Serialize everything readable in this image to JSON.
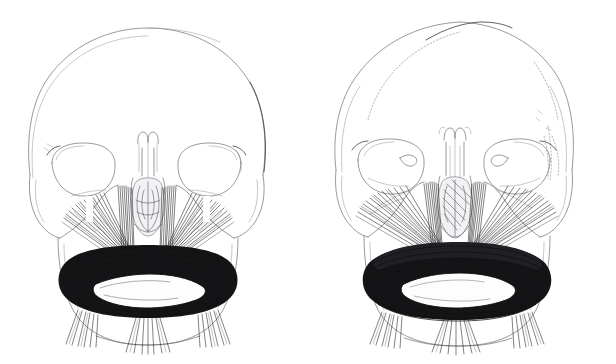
{
  "figure": {
    "background_color": "#ffffff",
    "width": 616,
    "height": 364,
    "medium": "pen-and-ink anatomical line drawing",
    "panel_count": 2
  },
  "palette": {
    "background": "#ffffff",
    "bone_outline": "#6e6e73",
    "bone_faint": "#9a9aa0",
    "bone_dark": "#3a3a3e",
    "suture": "#8a8a90",
    "muscle_fiber": "#1a1a1c",
    "muscle_soft": "#44444a",
    "orbicularis_mass": "#141416",
    "mouth_aperture": "#fdfdfd",
    "nasal_cartilage": "#4a4a50"
  },
  "panels": [
    {
      "id": "left",
      "label": "Left figure",
      "caption": "",
      "skull": {
        "name": "frontal-skull-left",
        "cranium_style": "plain smooth vault, no sutures drawn",
        "orbits": 2,
        "mandible": "broad rounded symphysis"
      },
      "muscles": {
        "orbicularis_oris": "dense near-black elliptical band encircling the oral aperture",
        "levator_group": "paired vertical fiber bundles from infraorbital margin to upper lip",
        "zygomatic_group": "oblique fiber bundles from zygomatic arch to modiolus",
        "depressor_group": "fan of fibers descending from lower lip over the chin",
        "mentalis": "central chin fan"
      }
    },
    {
      "id": "right",
      "label": "Right figure",
      "caption": "",
      "skull": {
        "name": "frontal-skull-right",
        "cranium_style": "vault outlined with stippled coronal and lambdoid suture marks",
        "orbits": 2,
        "mandible": "broad rounded symphysis"
      },
      "muscles": {
        "orbicularis_oris": "heavy layered black band, fibers swept laterally into the cheeks",
        "levator_group": "steep converging bundles beside the nasal aperture",
        "zygomatic_group": "long radiating bundles reaching far laterally to the rami",
        "depressor_group": "fan of fibers descending from lower lip over the chin",
        "mentalis": "central chin fan"
      }
    }
  ],
  "annotations": {
    "text_labels": [],
    "leader_lines": 0,
    "note": "No captions, numbers, or lettering appear anywhere in the image."
  }
}
